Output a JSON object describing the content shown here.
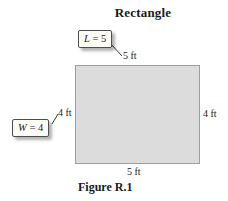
{
  "title": "Rectangle",
  "caption": "Figure R.1",
  "rectangle": {
    "top_label": "5 ft",
    "right_label": "4 ft",
    "bottom_label": "5 ft",
    "left_label": "4 ft"
  },
  "callouts": {
    "length": {
      "symbol": "L",
      "rest": " = 5"
    },
    "width": {
      "symbol": "W",
      "rest": " = 4"
    }
  },
  "colors": {
    "rect_fill": "#dcdcdc",
    "rect_border": "#9e9e9e",
    "callout_bg": "#fdfcf5",
    "callout_border": "#4d4d4d",
    "leader_line": "#333333",
    "text": "#1a1a1a",
    "background": "#ffffff"
  }
}
